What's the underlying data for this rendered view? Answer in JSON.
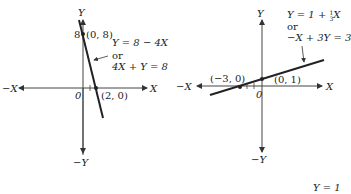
{
  "graphs": [
    {
      "id": "left",
      "axis_labels": {
        "y_pos": "Y",
        "y_neg": "−Y",
        "x_pos": "X",
        "x_neg": "−X",
        "origin": "0"
      },
      "y_intercept_tick": "8",
      "points": [
        {
          "label": "(0, 8)",
          "x": 0,
          "y": 8
        },
        {
          "label": "(2, 0)",
          "x": 2,
          "y": 0
        }
      ],
      "equation": {
        "line1": "Y = 8 − 4X",
        "or": "or",
        "line2": "4X + Y = 8"
      }
    },
    {
      "id": "right",
      "axis_labels": {
        "y_pos": "Y",
        "y_neg": "−Y",
        "x_pos": "X",
        "x_neg": "−X",
        "origin": "0"
      },
      "points": [
        {
          "label": "(−3, 0)",
          "x": -3,
          "y": 0
        },
        {
          "label": "(0, 1)",
          "x": 0,
          "y": 1
        }
      ],
      "equation": {
        "line1_prefix": "Y = 1 + ",
        "frac_num": "1",
        "frac_den": "3",
        "line1_suffix": "X",
        "or": "or",
        "line2": "−X + 3Y = 3"
      }
    }
  ],
  "footer_partial": "Y = 1"
}
